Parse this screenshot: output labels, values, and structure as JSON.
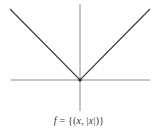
{
  "chart_data": {
    "type": "line",
    "title": "",
    "caption": "f = {(x, |x|)}",
    "xlabel": "",
    "ylabel": "",
    "x": [
      -1,
      0,
      1
    ],
    "series": [
      {
        "name": "f(x) = |x|",
        "values": [
          1,
          0,
          1
        ]
      }
    ],
    "xlim": [
      -1,
      1
    ],
    "ylim": [
      -0.45,
      1.05
    ],
    "grid": false,
    "legend": "none",
    "axes_through_origin": true
  },
  "colors": {
    "curve": "#3a3a3a",
    "axes": "#8a8a8a",
    "vertex": "#222222",
    "background": "#ffffff"
  },
  "caption": {
    "f": "f",
    "eq": " = {(",
    "x1": "x",
    "mid": ", |",
    "x2": "x",
    "end": "|)}"
  }
}
